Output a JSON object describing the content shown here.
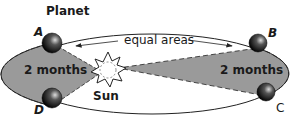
{
  "diagram": {
    "title": "Planet",
    "sun_label": "Sun",
    "area_label": "equal areas",
    "left_sector_label": "2 months",
    "right_sector_label": "2 months",
    "points": [
      {
        "id": "A",
        "label": "A"
      },
      {
        "id": "B",
        "label": "B"
      },
      {
        "id": "C",
        "label": "C"
      },
      {
        "id": "D",
        "label": "D"
      }
    ],
    "colors": {
      "sector_fill": "#9a9a9a",
      "orbit": "#222222",
      "planet": "#1a1a1a",
      "sun_fill": "#ffffff"
    }
  }
}
